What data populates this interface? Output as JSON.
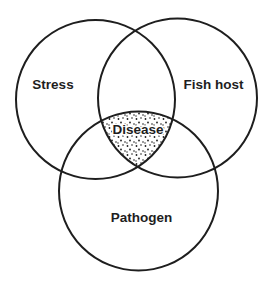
{
  "diagram": {
    "type": "venn",
    "stroke_color": "#1e1e1e",
    "background": "#ffffff",
    "sets": [
      {
        "id": "stress",
        "label": "Stress",
        "cx": 95.5,
        "cy": 99.5,
        "r": 79.5,
        "label_x": 53,
        "label_y": 89
      },
      {
        "id": "fish-host",
        "label": "Fish host",
        "cx": 177.5,
        "cy": 98,
        "r": 79.5,
        "label_x": 213.5,
        "label_y": 89
      },
      {
        "id": "pathogen",
        "label": "Pathogen",
        "cx": 138.5,
        "cy": 191,
        "r": 79.5,
        "label_x": 141.5,
        "label_y": 222
      }
    ],
    "intersection": {
      "label": "Disease",
      "of": [
        "Stress",
        "Fish host",
        "Pathogen"
      ],
      "fill": "stippled",
      "label_x": 138,
      "label_y": 134
    }
  }
}
